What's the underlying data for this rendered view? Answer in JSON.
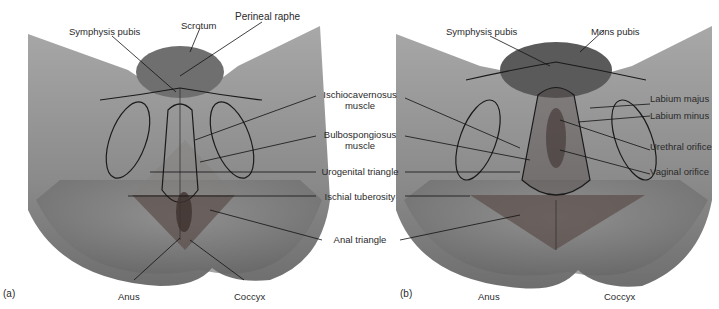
{
  "figure": {
    "panels": [
      {
        "tag": "(a)",
        "labels": {
          "symphysis_pubis": "Symphysis pubis",
          "scrotum": "Scrotum",
          "perineal_raphe": "Perineal raphe",
          "anus": "Anus",
          "coccyx": "Coccyx"
        }
      },
      {
        "tag": "(b)",
        "labels": {
          "symphysis_pubis": "Symphysis pubis",
          "mons_pubis": "Mons pubis",
          "labium_majus": "Labium majus",
          "labium_minus": "Labium minus",
          "urethral_orifice": "Urethral orifice",
          "vaginal_orifice": "Vaginal orifice",
          "anus": "Anus",
          "coccyx": "Coccyx"
        }
      }
    ],
    "shared_labels": {
      "ischiocavernosus_line1": "Ischiocavernosus",
      "ischiocavernosus_line2": "muscle",
      "bulbospongiosus_line1": "Bulbospongiosus",
      "bulbospongiosus_line2": "muscle",
      "urogenital_triangle": "Urogenital triangle",
      "ischial_tuberosity": "Ischial tuberosity",
      "anal_triangle": "Anal triangle"
    },
    "colors": {
      "skin_light": "#b8b8b8",
      "skin_dark": "#7a7a7a",
      "triangle_shade": "#6a5a58",
      "outline": "#1a1a1a",
      "text": "#2a2a2a"
    }
  }
}
